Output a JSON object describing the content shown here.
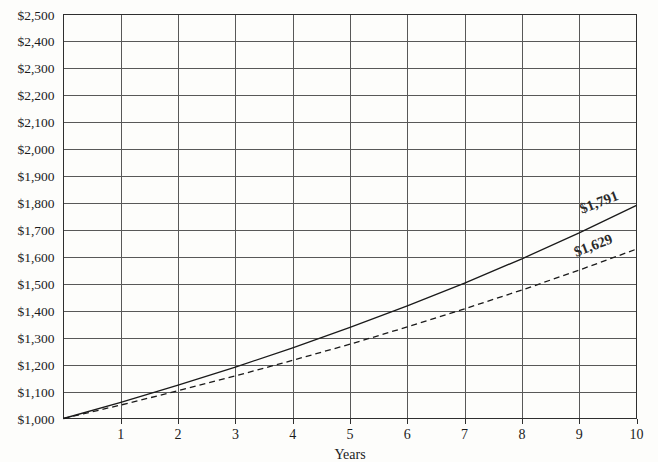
{
  "chart_data": {
    "type": "line",
    "title": "",
    "xlabel": "Years",
    "ylabel": "",
    "xlim": [
      0,
      10
    ],
    "ylim": [
      1000,
      2500
    ],
    "grid": true,
    "legend": "none",
    "x": [
      0,
      1,
      2,
      3,
      4,
      5,
      6,
      7,
      8,
      9,
      10
    ],
    "xtick_labels": [
      "1",
      "2",
      "3",
      "4",
      "5",
      "6",
      "7",
      "8",
      "9",
      "10"
    ],
    "ytick_labels": [
      "$2,500",
      "$2,400",
      "$2,300",
      "$2,200",
      "$2,100",
      "$2,000",
      "$1,900",
      "$1,800",
      "$1,700",
      "$1,600",
      "$1,500",
      "$1,400",
      "$1,300",
      "$1,200",
      "$1,100",
      "$1,000"
    ],
    "ytick_values": [
      2500,
      2400,
      2300,
      2200,
      2100,
      2000,
      1900,
      1800,
      1700,
      1600,
      1500,
      1400,
      1300,
      1200,
      1100,
      1000
    ],
    "series": [
      {
        "name": "upper-series",
        "style": "solid",
        "color": "#1a1a1a",
        "end_label": "$1,791",
        "end_value": 1791,
        "values": [
          1000,
          1060,
          1124,
          1191,
          1262,
          1338,
          1418,
          1503,
          1593,
          1689,
          1791
        ]
      },
      {
        "name": "lower-series",
        "style": "dashed",
        "color": "#1a1a1a",
        "end_label": "$1,629",
        "end_value": 1629,
        "values": [
          1000,
          1050,
          1103,
          1158,
          1216,
          1276,
          1340,
          1407,
          1477,
          1551,
          1629
        ]
      }
    ],
    "annotations": [
      {
        "text": "$1,791",
        "x": 9.05,
        "y": 1760,
        "rotation": -21
      },
      {
        "text": "$1,629",
        "x": 8.95,
        "y": 1600,
        "rotation": -21
      }
    ]
  },
  "colors": {
    "background": "#fdfdfb",
    "grid": "#585858",
    "frame": "#2f2f2f",
    "text": "#1b1b1b",
    "series": "#1a1a1a"
  }
}
